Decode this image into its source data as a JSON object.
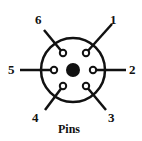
{
  "diagram": {
    "caption": "Pins",
    "pins": [
      {
        "label": "1",
        "x": 86,
        "y": 53,
        "lx": 112,
        "ly": 24,
        "tx": 110,
        "ty": 24
      },
      {
        "label": "2",
        "x": 93,
        "y": 70,
        "lx": 126,
        "ly": 70,
        "tx": 129,
        "ty": 74
      },
      {
        "label": "3",
        "x": 86,
        "y": 86,
        "lx": 106,
        "ly": 110,
        "tx": 108,
        "ty": 122
      },
      {
        "label": "4",
        "x": 63,
        "y": 86,
        "lx": 45,
        "ly": 110,
        "tx": 32,
        "ty": 122
      },
      {
        "label": "5",
        "x": 54,
        "y": 70,
        "lx": 20,
        "ly": 70,
        "tx": 8,
        "ty": 74
      },
      {
        "label": "6",
        "x": 63,
        "y": 53,
        "lx": 44,
        "ly": 30,
        "tx": 35,
        "ty": 24
      }
    ],
    "colors": {
      "stroke": "#111111",
      "bg": "#ffffff"
    }
  }
}
